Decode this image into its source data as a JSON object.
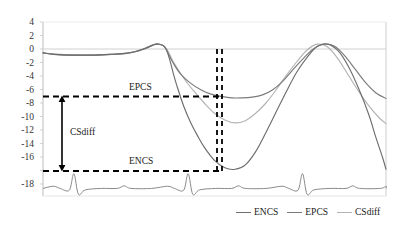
{
  "chart_data": {
    "type": "line",
    "title": "",
    "xlabel": "",
    "ylabel": "",
    "ylim": [
      -18,
      4
    ],
    "xlim": [
      0,
      100
    ],
    "grid": false,
    "zero_line": true,
    "y_ticks": [
      4,
      2,
      0,
      -2,
      -4,
      -6,
      -8,
      -10,
      -12,
      -14,
      -16,
      -18
    ],
    "y_tick_labels": [
      "4",
      "2",
      "0",
      "-2",
      "-4",
      "-6",
      "-8",
      "-10",
      "-12",
      "-14",
      "-16",
      "-18"
    ],
    "x_ticks": [],
    "x_tick_labels": [],
    "legend_position": "bottom-right",
    "series": [
      {
        "name": "ENCS",
        "color": "#6e6e6e",
        "min_value": -16,
        "max_value": 1.0,
        "x": [
          0,
          3,
          7,
          11,
          15,
          19,
          23,
          27,
          31,
          33,
          35,
          36,
          37,
          38,
          39,
          41,
          43,
          45,
          47,
          50,
          53,
          56,
          59,
          62,
          65,
          68,
          71,
          74,
          77,
          80,
          83,
          86,
          89,
          92,
          95,
          97,
          99,
          100
        ],
        "values": [
          -0.2,
          -0.4,
          -0.5,
          -0.5,
          -0.5,
          -0.4,
          -0.3,
          0.0,
          0.6,
          1.0,
          0.8,
          0.2,
          -1.2,
          -3.0,
          -4.6,
          -7.4,
          -9.6,
          -11.4,
          -13.0,
          -14.8,
          -15.8,
          -16.0,
          -15.4,
          -13.6,
          -11.0,
          -8.2,
          -5.4,
          -2.8,
          -0.8,
          0.7,
          1.0,
          0.1,
          -2.0,
          -5.0,
          -8.6,
          -11.6,
          -14.4,
          -16.0
        ]
      },
      {
        "name": "EPCS",
        "color": "#7b7b7b",
        "min_value": -6.3,
        "max_value": 1.0,
        "x": [
          0,
          4,
          8,
          12,
          16,
          20,
          24,
          28,
          31,
          33,
          35,
          36,
          38,
          40,
          43,
          46,
          49,
          52,
          55,
          58,
          61,
          64,
          67,
          70,
          73,
          76,
          79,
          82,
          85,
          88,
          91,
          94,
          97,
          100
        ],
        "values": [
          -0.2,
          -0.4,
          -0.5,
          -0.5,
          -0.5,
          -0.4,
          -0.3,
          0.1,
          0.7,
          1.0,
          0.8,
          0.2,
          -1.6,
          -3.0,
          -4.3,
          -5.2,
          -5.8,
          -6.1,
          -6.3,
          -6.3,
          -6.2,
          -5.9,
          -5.2,
          -4.0,
          -2.4,
          -0.9,
          0.4,
          1.0,
          0.7,
          -0.6,
          -2.4,
          -4.2,
          -5.6,
          -6.4
        ]
      },
      {
        "name": "CSdiff",
        "color": "#b3b3b3",
        "min_value": -9.7,
        "max_value": 1.0,
        "x": [
          0,
          5,
          10,
          15,
          20,
          25,
          29,
          32,
          34,
          36,
          38,
          41,
          44,
          47,
          50,
          53,
          56,
          59,
          62,
          65,
          68,
          71,
          74,
          77,
          80,
          83,
          86,
          89,
          92,
          95,
          98,
          100
        ],
        "values": [
          -0.2,
          -0.4,
          -0.5,
          -0.5,
          -0.4,
          -0.2,
          0.3,
          0.9,
          1.0,
          0.4,
          -1.4,
          -3.6,
          -5.4,
          -7.0,
          -8.4,
          -9.3,
          -9.7,
          -9.4,
          -8.4,
          -7.0,
          -5.2,
          -3.2,
          -1.4,
          0.2,
          1.0,
          0.6,
          -1.0,
          -3.2,
          -5.4,
          -7.4,
          -9.0,
          -9.8
        ]
      }
    ],
    "baseline_trace": {
      "name": "ecg-baseline",
      "color": "#8a8a8a",
      "baseline_value": -18.6,
      "spike_peak_value": -16.6,
      "trough_value": -19.4
    },
    "annotations": [
      {
        "name": "EPCS",
        "label": "EPCS",
        "type": "horizontal-reference-line",
        "value": -6,
        "style": "dashed",
        "color": "#000000"
      },
      {
        "name": "ENCS",
        "label": "ENCS",
        "type": "horizontal-reference-line",
        "value": -16,
        "style": "dashed",
        "color": "#000000"
      },
      {
        "name": "CSdiff",
        "label": "CSdiff",
        "type": "double-arrow-measure",
        "from": -6,
        "to": -16,
        "magnitude": 10,
        "color": "#000000"
      }
    ],
    "vertical_markers": {
      "style": "dashed",
      "color": "#000000",
      "from_value": 0,
      "to_value": -16,
      "count": 2
    }
  },
  "axis": {
    "labels": {
      "t0": "4",
      "t1": "2",
      "t2": "0",
      "t3": "-2",
      "t4": "-4",
      "t5": "-6",
      "t6": "-8",
      "t7": "-10",
      "t8": "-12",
      "t9": "-14",
      "t10": "-16",
      "t11": "-18"
    }
  },
  "annotations_text": {
    "epcs": "EPCS",
    "encs": "ENCS",
    "csdiff": "CSdiff"
  },
  "legend": {
    "items": [
      {
        "label": "ENCS",
        "color": "#6e6e6e"
      },
      {
        "label": "EPCS",
        "color": "#7b7b7b"
      },
      {
        "label": "CSdiff",
        "color": "#b3b3b3"
      }
    ]
  }
}
